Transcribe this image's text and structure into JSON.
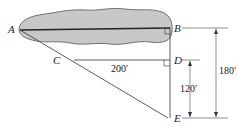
{
  "diagram": {
    "type": "geometry-figure",
    "points": {
      "A": {
        "label": "A",
        "x": 20,
        "y": 30
      },
      "B": {
        "label": "B",
        "x": 170,
        "y": 28
      },
      "C": {
        "label": "C",
        "x": 70,
        "y": 60
      },
      "D": {
        "label": "D",
        "x": 170,
        "y": 60
      },
      "E": {
        "label": "E",
        "x": 170,
        "y": 118
      }
    },
    "dimensions": {
      "CD": {
        "label": "200′"
      },
      "DE": {
        "label": "120′"
      },
      "BE": {
        "label": "180′"
      }
    },
    "colors": {
      "lake_fill": "#c8c8c8",
      "lake_outline": "#555555",
      "line": "#333333",
      "background": "#ffffff"
    }
  }
}
